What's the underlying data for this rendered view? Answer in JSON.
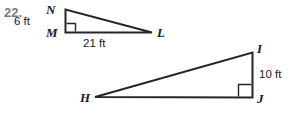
{
  "problem": {
    "number": "22."
  },
  "figures": [
    {
      "name": "triangle-NML",
      "vertices": [
        {
          "label": "N",
          "x": 65,
          "y": 10
        },
        {
          "label": "M",
          "x": 65,
          "y": 32
        },
        {
          "label": "L",
          "x": 152,
          "y": 32
        }
      ],
      "right_angle_at": "M",
      "measures": [
        {
          "label": "6 ft",
          "side": "NM"
        },
        {
          "label": "21 ft",
          "side": "ML"
        }
      ]
    },
    {
      "name": "triangle-HIJ",
      "vertices": [
        {
          "label": "H",
          "x": 95,
          "y": 97
        },
        {
          "label": "I",
          "x": 252,
          "y": 53
        },
        {
          "label": "J",
          "x": 252,
          "y": 97
        }
      ],
      "right_angle_at": "J",
      "measures": [
        {
          "label": "10 ft",
          "side": "IJ"
        }
      ]
    }
  ],
  "labels": {
    "n": "N",
    "m": "M",
    "l": "L",
    "h": "H",
    "i": "I",
    "j": "J",
    "six_ft": "6 ft",
    "twentyone_ft": "21 ft",
    "ten_ft": "10 ft"
  },
  "colors": {
    "stroke": "#262626",
    "text": "#1a1a1a",
    "number": "#7a7a7a",
    "background": "#ffffff"
  }
}
